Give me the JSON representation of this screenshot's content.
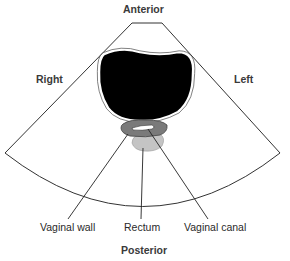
{
  "diagram": {
    "orientation_labels": {
      "top": "Anterior",
      "bottom": "Posterior",
      "left": "Right",
      "right": "Left"
    },
    "structures": [
      {
        "id": "bladder",
        "fill": "#000000"
      },
      {
        "id": "vaginal_wall",
        "label": "Vaginal wall",
        "fill": "#7a7a7a"
      },
      {
        "id": "vaginal_canal",
        "label": "Vaginal canal",
        "fill": "#ffffff"
      },
      {
        "id": "rectum",
        "label": "Rectum",
        "fill": "#c4c4c4"
      }
    ],
    "callouts": {
      "vaginal_wall": "Vaginal wall",
      "rectum": "Rectum",
      "vaginal_canal": "Vaginal canal"
    }
  }
}
